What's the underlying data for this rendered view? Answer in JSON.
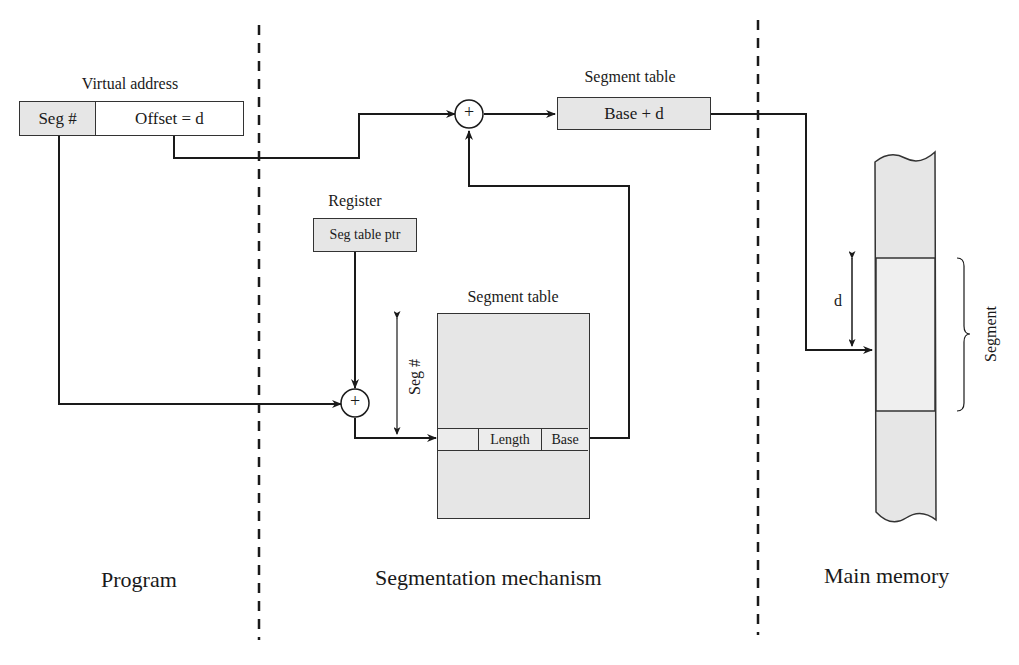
{
  "program": {
    "section_label": "Program",
    "virtual_address": {
      "title": "Virtual address",
      "seg_field": "Seg #",
      "offset_field": "Offset = d"
    }
  },
  "segmentation_mechanism": {
    "section_label": "Segmentation mechanism",
    "register": {
      "title": "Register",
      "value": "Seg table ptr"
    },
    "adder_top_symbol": "+",
    "adder_bottom_symbol": "+",
    "result_table": {
      "title": "Segment table",
      "value": "Base + d"
    },
    "segment_table": {
      "title": "Segment table",
      "entry_fields": [
        "",
        "Length",
        "Base"
      ],
      "index_label": "Seg #"
    }
  },
  "main_memory": {
    "section_label": "Main memory",
    "offset_label": "d",
    "segment_label": "Segment"
  },
  "colors": {
    "box_fill": "#e6e6e6",
    "line": "#1a1a1a",
    "divider": "#1a1a1a"
  }
}
